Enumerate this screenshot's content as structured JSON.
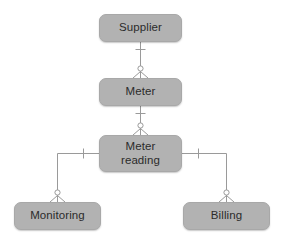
{
  "diagram": {
    "type": "entity-relationship-diagram",
    "notation": "crow's foot",
    "background_color": "#ffffff",
    "box_fill_color": "#b2b2b2",
    "box_border_color": "#a8a8a8",
    "line_color": "#9a9a9a",
    "text_color": "#2b2b2b",
    "entities": [
      {
        "id": "supplier",
        "label": "Supplier",
        "x": 99,
        "y": 14,
        "width": 83,
        "height": 28
      },
      {
        "id": "meter",
        "label": "Meter",
        "x": 99,
        "y": 78,
        "width": 83,
        "height": 28
      },
      {
        "id": "meter-reading",
        "label": "Meter\nreading",
        "x": 99,
        "y": 135,
        "width": 83,
        "height": 37
      },
      {
        "id": "monitoring",
        "label": "Monitoring",
        "x": 14,
        "y": 202,
        "width": 87,
        "height": 28
      },
      {
        "id": "billing",
        "label": "Billing",
        "x": 183,
        "y": 202,
        "width": 87,
        "height": 28
      }
    ],
    "relationships": [
      {
        "id": "supplier-meter",
        "from": "supplier",
        "to": "meter",
        "from_cardinality": "one",
        "to_cardinality": "zero-or-many"
      },
      {
        "id": "meter-meter-reading",
        "from": "meter",
        "to": "meter-reading",
        "from_cardinality": "one",
        "to_cardinality": "zero-or-many"
      },
      {
        "id": "meter-reading-monitoring",
        "from": "meter-reading",
        "to": "monitoring",
        "from_cardinality": "one",
        "to_cardinality": "zero-or-many"
      },
      {
        "id": "meter-reading-billing",
        "from": "meter-reading",
        "to": "billing",
        "from_cardinality": "one",
        "to_cardinality": "zero-or-many"
      }
    ]
  }
}
